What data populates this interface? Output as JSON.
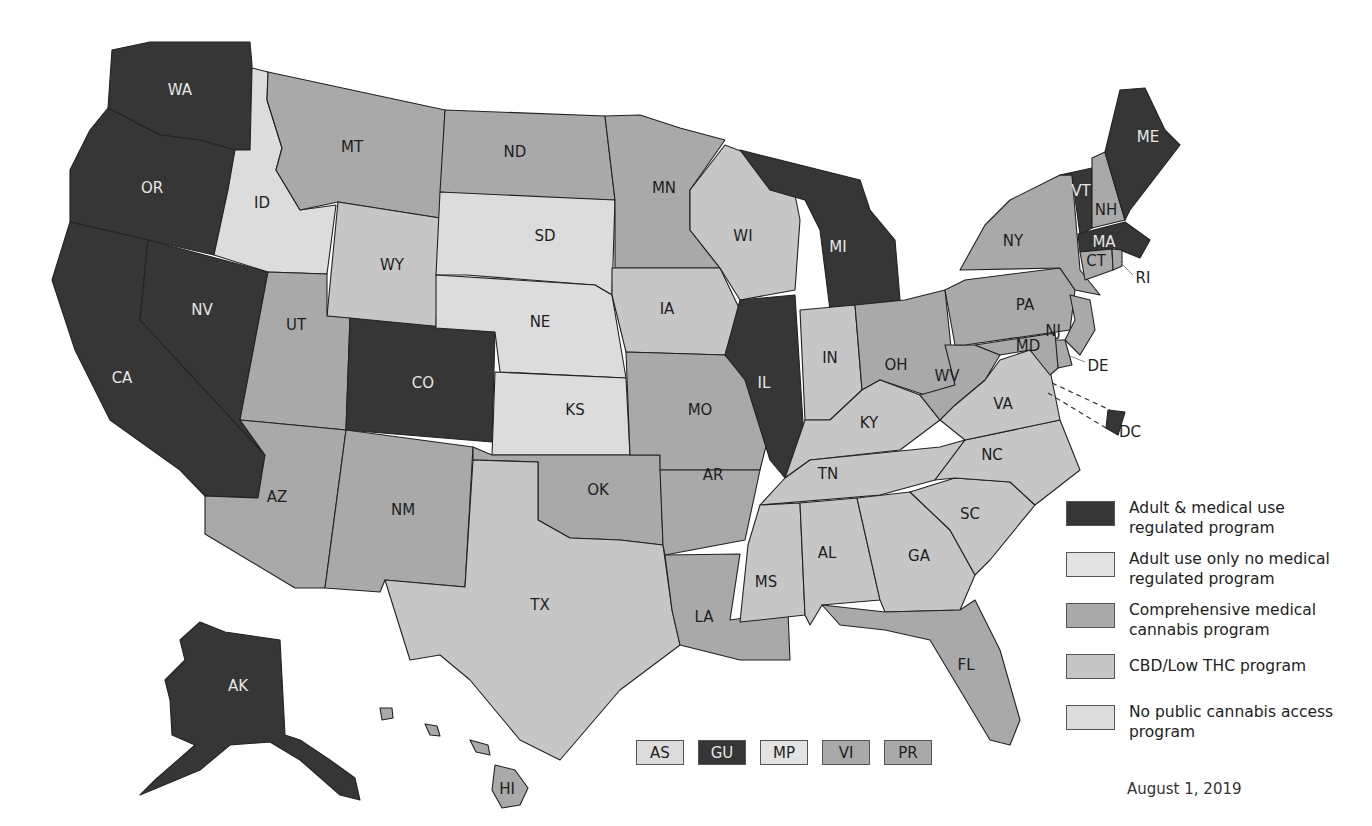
{
  "colors": {
    "adult_medical": "#363636",
    "adult_only": "#e3e3e3",
    "comprehensive_medical": "#a9a9a9",
    "cbd_low_thc": "#c6c6c6",
    "no_program": "#dcdcdc"
  },
  "legend": {
    "items": [
      {
        "key": "adult_medical",
        "label": "Adult & medical use regulated program"
      },
      {
        "key": "adult_only",
        "label": "Adult use only no medical regulated program"
      },
      {
        "key": "comprehensive_medical",
        "label": "Comprehensive medical cannabis program"
      },
      {
        "key": "cbd_low_thc",
        "label": "CBD/Low THC program"
      },
      {
        "key": "no_program",
        "label": "No public cannabis access program"
      }
    ],
    "date": "August 1, 2019"
  },
  "territories": [
    {
      "code": "AS",
      "category": "no_program"
    },
    {
      "code": "GU",
      "category": "adult_medical"
    },
    {
      "code": "MP",
      "category": "adult_only"
    },
    {
      "code": "VI",
      "category": "comprehensive_medical"
    },
    {
      "code": "PR",
      "category": "comprehensive_medical"
    }
  ],
  "states": {
    "WA": "adult_medical",
    "OR": "adult_medical",
    "CA": "adult_medical",
    "NV": "adult_medical",
    "ID": "no_program",
    "MT": "comprehensive_medical",
    "WY": "cbd_low_thc",
    "UT": "comprehensive_medical",
    "CO": "adult_medical",
    "AZ": "comprehensive_medical",
    "NM": "comprehensive_medical",
    "ND": "comprehensive_medical",
    "SD": "no_program",
    "NE": "no_program",
    "KS": "no_program",
    "OK": "comprehensive_medical",
    "TX": "cbd_low_thc",
    "MN": "comprehensive_medical",
    "IA": "cbd_low_thc",
    "MO": "comprehensive_medical",
    "AR": "comprehensive_medical",
    "LA": "comprehensive_medical",
    "WI": "cbd_low_thc",
    "IL": "adult_medical",
    "MI": "adult_medical",
    "IN": "cbd_low_thc",
    "OH": "comprehensive_medical",
    "KY": "cbd_low_thc",
    "TN": "cbd_low_thc",
    "MS": "cbd_low_thc",
    "AL": "cbd_low_thc",
    "GA": "cbd_low_thc",
    "FL": "comprehensive_medical",
    "SC": "cbd_low_thc",
    "NC": "cbd_low_thc",
    "VA": "cbd_low_thc",
    "WV": "comprehensive_medical",
    "PA": "comprehensive_medical",
    "NY": "comprehensive_medical",
    "VT": "adult_medical",
    "NH": "comprehensive_medical",
    "ME": "adult_medical",
    "MA": "adult_medical",
    "RI": "comprehensive_medical",
    "CT": "comprehensive_medical",
    "NJ": "comprehensive_medical",
    "DE": "comprehensive_medical",
    "MD": "comprehensive_medical",
    "DC": "adult_medical",
    "AK": "adult_medical",
    "HI": "comprehensive_medical"
  },
  "state_labels": [
    "WA",
    "OR",
    "CA",
    "NV",
    "ID",
    "MT",
    "WY",
    "UT",
    "CO",
    "AZ",
    "NM",
    "ND",
    "SD",
    "NE",
    "KS",
    "OK",
    "TX",
    "MN",
    "IA",
    "MO",
    "AR",
    "LA",
    "WI",
    "IL",
    "MI",
    "IN",
    "OH",
    "KY",
    "TN",
    "MS",
    "AL",
    "GA",
    "FL",
    "SC",
    "NC",
    "VA",
    "WV",
    "PA",
    "NY",
    "VT",
    "NH",
    "ME",
    "MA",
    "CT",
    "RI",
    "NJ",
    "DE",
    "MD",
    "DC",
    "AK",
    "HI"
  ]
}
